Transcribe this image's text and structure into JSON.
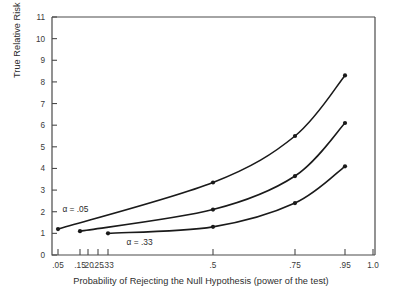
{
  "chart_data": {
    "type": "line",
    "title": "",
    "xlabel": "Probability of Rejecting the Null Hypothesis (power of the test)",
    "ylabel": "True Relative Risk",
    "xlim": [
      0.0,
      1.0
    ],
    "ylim": [
      0,
      11
    ],
    "grid": false,
    "legend": "none",
    "x_tick_labels": [
      ".05",
      ".15",
      ".20",
      ".25",
      ".33",
      ".5",
      ".75",
      ".95",
      "1.0"
    ],
    "x_tick_values": [
      0.05,
      0.15,
      0.2,
      0.25,
      0.33,
      0.5,
      0.75,
      0.95,
      1.0
    ],
    "y_tick_labels": [
      "0",
      "1",
      "2",
      "3",
      "4",
      "5",
      "6",
      "7",
      "8",
      "9",
      "10",
      "11"
    ],
    "y_tick_values": [
      0,
      1,
      2,
      3,
      4,
      5,
      6,
      7,
      8,
      9,
      10,
      11
    ],
    "series": [
      {
        "name": "alpha = .05",
        "x": [
          0.05,
          0.5,
          0.75,
          0.95
        ],
        "values": [
          1.2,
          3.35,
          5.5,
          8.3
        ]
      },
      {
        "name": "alpha = .17",
        "x": [
          0.15,
          0.5,
          0.75,
          0.95
        ],
        "values": [
          1.1,
          2.1,
          3.65,
          6.1
        ]
      },
      {
        "name": "alpha = .33",
        "x": [
          0.33,
          0.5,
          0.75,
          0.95
        ],
        "values": [
          1.0,
          1.3,
          2.4,
          4.1
        ]
      }
    ],
    "annotations": [
      {
        "text": "α = .05",
        "x": 0.07,
        "y": 2.0
      },
      {
        "text": "α = .33",
        "x": 0.36,
        "y": 0.45
      }
    ]
  },
  "figure": {
    "xaxis_title": "Probability of Rejecting the Null Hypothesis (power of the test)",
    "yaxis_title": "True Relative Risk",
    "annotation_alpha_05": "α = .05",
    "annotation_alpha_33": "α = .33"
  }
}
